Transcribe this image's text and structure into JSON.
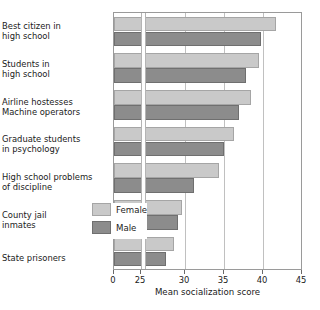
{
  "chart_data": {
    "type": "bar",
    "orientation": "horizontal",
    "title": "",
    "xlabel": "Mean socialization score",
    "ylabel": "",
    "xlim": [
      0,
      45
    ],
    "axis_break": {
      "from": 0,
      "to": 25
    },
    "grid": true,
    "xticks": [
      0,
      25,
      30,
      35,
      40,
      45
    ],
    "xtick_labels": [
      "0",
      "25",
      "30",
      "35",
      "40",
      "45"
    ],
    "legend_position": "inside lower right",
    "categories": [
      "Best citizen in\nhigh school",
      "Students in\nhigh school",
      "Airline hostesses\nMachine operators",
      "Graduate students\nin psychology",
      "High school problems\nof discipline",
      "County jail\ninmates",
      "State prisoners"
    ],
    "series": [
      {
        "name": "Female",
        "color": "#c9c9c9",
        "values": [
          41.7,
          39.5,
          38.4,
          36.3,
          34.4,
          29.6,
          28.6
        ]
      },
      {
        "name": "Male",
        "color": "#8c8c8c",
        "values": [
          39.7,
          37.8,
          36.9,
          35.0,
          31.2,
          29.1,
          27.5
        ]
      }
    ]
  },
  "legend": {
    "items": [
      {
        "label": "Female",
        "color": "#c9c9c9"
      },
      {
        "label": "Male",
        "color": "#8c8c8c"
      }
    ]
  },
  "axis": {
    "x_title": "Mean socialization score",
    "tick_labels": [
      "0",
      "25",
      "30",
      "35",
      "40",
      "45"
    ]
  },
  "categories": [
    {
      "label": "Best citizen in\nhigh school"
    },
    {
      "label": "Students in\nhigh school"
    },
    {
      "label": "Airline hostesses\nMachine operators"
    },
    {
      "label": "Graduate students\nin psychology"
    },
    {
      "label": "High school problems\nof discipline"
    },
    {
      "label": "County jail\ninmates"
    },
    {
      "label": "State prisoners"
    }
  ]
}
